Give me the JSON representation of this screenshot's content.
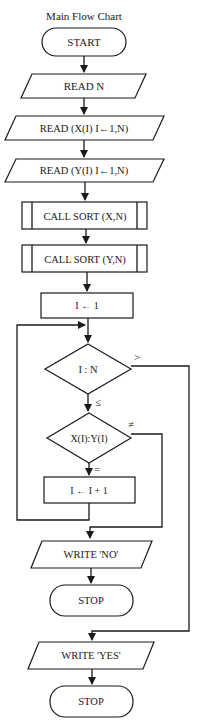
{
  "title": "Main Flow Chart",
  "nodes": {
    "start": "START",
    "read_n": "READ N",
    "read_x": "READ (X(I) I←1,N)",
    "read_y": "READ (Y(I) I←1,N)",
    "call_sort_x": "CALL SORT (X,N)",
    "call_sort_y": "CALL SORT (Y,N)",
    "init_i": "I ← 1",
    "compare_i_n": "I : N",
    "compare_xy": "X(I):Y(I)",
    "increment_i": "I ← I + 1",
    "write_no": "WRITE 'NO'",
    "stop_1": "STOP",
    "write_yes": "WRITE 'YES'",
    "stop_2": "STOP"
  },
  "edge_labels": {
    "greater": ">",
    "less_equal": "≤",
    "not_equal": "≠",
    "equal": "="
  },
  "colors": {
    "stroke": "#1a1a1a",
    "background": "#ffffff"
  }
}
